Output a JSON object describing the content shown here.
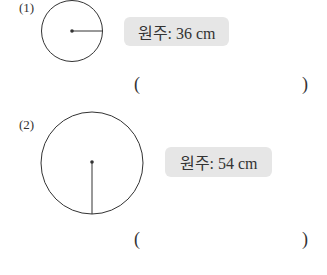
{
  "problems": [
    {
      "number": "(1)",
      "circumference_label": "원주: 36 cm",
      "radius_direction": "horizontal",
      "answer_open": "(",
      "answer_close": ")"
    },
    {
      "number": "(2)",
      "circumference_label": "원주: 54 cm",
      "radius_direction": "vertical",
      "answer_open": "(",
      "answer_close": ")"
    }
  ]
}
